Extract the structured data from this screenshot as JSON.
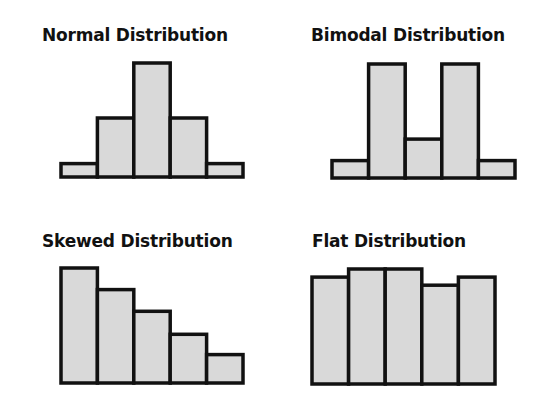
{
  "chart_data": [
    {
      "type": "bar",
      "title": "Normal Distribution",
      "categories": [
        "1",
        "2",
        "3",
        "4",
        "5"
      ],
      "values": [
        1,
        4.4,
        8.5,
        4.4,
        1
      ],
      "xlabel": "",
      "ylabel": "",
      "grid": false,
      "bar_color": "#d9d9d9",
      "edge_color": "#111111"
    },
    {
      "type": "bar",
      "title": "Bimodal Distribution",
      "categories": [
        "1",
        "2",
        "3",
        "4",
        "5"
      ],
      "values": [
        1.3,
        8.5,
        2.9,
        8.5,
        1.3
      ],
      "xlabel": "",
      "ylabel": "",
      "grid": false,
      "bar_color": "#d9d9d9",
      "edge_color": "#111111"
    },
    {
      "type": "bar",
      "title": "Skewed Distribution",
      "categories": [
        "1",
        "2",
        "3",
        "4",
        "5"
      ],
      "values": [
        8.5,
        6.9,
        5.3,
        3.6,
        2.1
      ],
      "xlabel": "",
      "ylabel": "",
      "grid": false,
      "bar_color": "#d9d9d9",
      "edge_color": "#111111"
    },
    {
      "type": "bar",
      "title": "Flat Distribution",
      "categories": [
        "1",
        "2",
        "3",
        "4",
        "5"
      ],
      "values": [
        7.9,
        8.5,
        8.5,
        7.3,
        7.9
      ],
      "xlabel": "",
      "ylabel": "",
      "grid": false,
      "bar_color": "#d9d9d9",
      "edge_color": "#111111"
    }
  ],
  "panels": {
    "normal": {
      "title": "Normal Distribution"
    },
    "bimodal": {
      "title": "Bimodal Distribution"
    },
    "skewed": {
      "title": "Skewed Distribution"
    },
    "flat": {
      "title": "Flat Distribution"
    }
  }
}
